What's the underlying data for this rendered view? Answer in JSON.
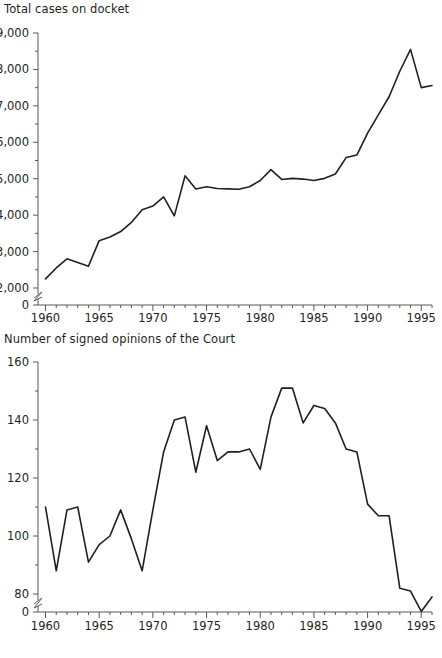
{
  "figure": {
    "background_color": "#ffffff",
    "line_color": "#231f20",
    "axis_color": "#58595b"
  },
  "panels": [
    {
      "id": "total-cases-on-docket",
      "title": "Total cases on docket"
    },
    {
      "id": "signed-opinions",
      "title": "Number of signed opinions of the Court"
    }
  ],
  "chart_data": [
    {
      "type": "line",
      "title": "Total cases on docket",
      "xlabel": "",
      "ylabel": "",
      "xlim": [
        1959.3,
        1996.0
      ],
      "ylim": [
        0,
        9000
      ],
      "y_axis_break": true,
      "y_break_between": [
        0,
        2000
      ],
      "grid": false,
      "legend": "none",
      "y_ticks_major": [
        0,
        2000,
        3000,
        4000,
        5000,
        6000,
        7000,
        8000,
        9000
      ],
      "y_ticks_major_labels": [
        "0",
        "2,000",
        "3,000",
        "4,000",
        "5,000",
        "6,000",
        "7,000",
        "8,000",
        "9,000"
      ],
      "y_ticks_minor_step": 500,
      "x_ticks_major": [
        1960,
        1965,
        1970,
        1975,
        1980,
        1985,
        1990,
        1995
      ],
      "x_ticks_major_labels": [
        "1960",
        "1965",
        "1970",
        "1975",
        "1980",
        "1985",
        "1990",
        "1995"
      ],
      "x_ticks_minor_step": 1,
      "x": [
        1960,
        1961,
        1962,
        1963,
        1964,
        1965,
        1966,
        1967,
        1968,
        1969,
        1970,
        1971,
        1972,
        1973,
        1974,
        1975,
        1976,
        1977,
        1978,
        1979,
        1980,
        1981,
        1982,
        1983,
        1984,
        1985,
        1986,
        1987,
        1988,
        1989,
        1990,
        1991,
        1992,
        1993,
        1994,
        1995
      ],
      "values": [
        2250,
        2550,
        2800,
        2700,
        2600,
        3300,
        3400,
        3550,
        3800,
        4150,
        4250,
        4500,
        3980,
        5080,
        4720,
        4780,
        4730,
        4720,
        4710,
        4780,
        4950,
        5250,
        4980,
        5010,
        4990,
        4950,
        5010,
        5130,
        5580,
        5650,
        6250,
        6750,
        7250,
        7950,
        8550,
        7500,
        7560
      ],
      "series_name": "Total cases on docket"
    },
    {
      "type": "line",
      "title": "Number of signed opinions of the Court",
      "xlabel": "",
      "ylabel": "",
      "xlim": [
        1959.3,
        1996.0
      ],
      "ylim": [
        0,
        160
      ],
      "y_axis_break": true,
      "y_break_between": [
        0,
        80
      ],
      "grid": false,
      "legend": "none",
      "y_ticks_major": [
        0,
        80,
        100,
        120,
        140,
        160
      ],
      "y_ticks_major_labels": [
        "0",
        "80",
        "100",
        "120",
        "140",
        "160"
      ],
      "y_ticks_minor_step": 10,
      "x_ticks_major": [
        1960,
        1965,
        1970,
        1975,
        1980,
        1985,
        1990,
        1995
      ],
      "x_ticks_major_labels": [
        "1960",
        "1965",
        "1970",
        "1975",
        "1980",
        "1985",
        "1990",
        "1995"
      ],
      "x_ticks_minor_step": 1,
      "x": [
        1960,
        1961,
        1962,
        1963,
        1964,
        1965,
        1966,
        1967,
        1968,
        1969,
        1970,
        1971,
        1972,
        1973,
        1974,
        1975,
        1976,
        1977,
        1978,
        1979,
        1980,
        1981,
        1982,
        1983,
        1984,
        1985,
        1986,
        1987,
        1988,
        1989,
        1990,
        1991,
        1992,
        1993,
        1994,
        1995
      ],
      "values": [
        110,
        88,
        109,
        110,
        91,
        97,
        100,
        109,
        99,
        88,
        109,
        129,
        140,
        141,
        122,
        138,
        126,
        129,
        129,
        130,
        123,
        141,
        151,
        151,
        139,
        145,
        144,
        139,
        130,
        129,
        111,
        107,
        107,
        82,
        81,
        74,
        79
      ],
      "series_name": "Number of signed opinions of the Court"
    }
  ]
}
